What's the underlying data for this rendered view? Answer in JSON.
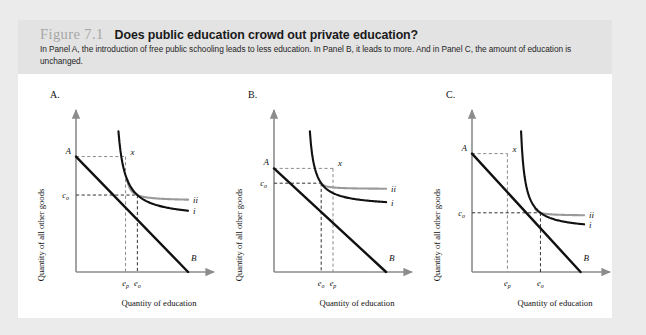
{
  "figure": {
    "number": "Figure 7.1",
    "title": "Does public education crowd out private education?",
    "caption": "In Panel A, the introduction of free public schooling leads to less education. In Panel B, it leads to more. And in Panel C, the amount of education is unchanged.",
    "background": "#ebebeb",
    "card_background": "#ffffff",
    "header_background": "#e3e3e3",
    "number_color": "#a6a6a6",
    "title_color": "#1a1a1a"
  },
  "axes": {
    "x_label": "Quantity of education",
    "y_label": "Quantity of all other goods",
    "axis_color": "#8c8c8c"
  },
  "styles": {
    "budget_line_color": "#111111",
    "curve_i_color": "#111111",
    "curve_ii_color": "#9a9a9a",
    "dashed_color": "#8c8c8c"
  },
  "labels": {
    "point_A": "A",
    "point_B": "B",
    "point_x": "x",
    "curve_i": "i",
    "curve_ii": "ii",
    "c_o_main": "c",
    "c_o_sub": "o",
    "e_p_main": "e",
    "e_p_sub": "p",
    "e_o_main": "e",
    "e_o_sub": "o"
  },
  "chart_data": {
    "type": "line",
    "title": "Does public education crowd out private education?",
    "xlabel": "Quantity of education",
    "ylabel": "Quantity of all other goods",
    "grid": false,
    "legend": "inline-curve-labels",
    "panels": [
      {
        "id": "A",
        "letter": "A.",
        "summary": "Introduction of free public schooling leads to less education.",
        "tick_order": [
          "e_p",
          "e_o"
        ],
        "x_ticks": [
          {
            "label": "e_p",
            "value": 0.42
          },
          {
            "label": "e_o",
            "value": 0.52
          }
        ],
        "y_ticks": [
          {
            "label": "c_o",
            "value": 0.52
          }
        ],
        "budget_line": {
          "name": "AB",
          "A_y": 0.78,
          "B_x": 0.95
        },
        "endowment_point_x": {
          "x": 0.42,
          "y": 0.78
        },
        "curve_i": {
          "name": "i",
          "x_asym": 0.3,
          "y_asym": 0.36
        },
        "curve_ii": {
          "name": "ii",
          "x_asym": 0.4,
          "y_asym": 0.48
        }
      },
      {
        "id": "B",
        "letter": "B.",
        "summary": "Introduction of free public schooling leads to more education.",
        "tick_order": [
          "e_o",
          "e_p"
        ],
        "x_ticks": [
          {
            "label": "e_o",
            "value": 0.4
          },
          {
            "label": "e_p",
            "value": 0.5
          }
        ],
        "y_ticks": [
          {
            "label": "c_o",
            "value": 0.6
          }
        ],
        "budget_line": {
          "name": "AB",
          "A_y": 0.7,
          "B_x": 0.95
        },
        "endowment_point_x": {
          "x": 0.5,
          "y": 0.7
        },
        "curve_i": {
          "name": "i",
          "x_asym": 0.26,
          "y_asym": 0.44
        },
        "curve_ii": {
          "name": "ii",
          "x_asym": 0.36,
          "y_asym": 0.56
        }
      },
      {
        "id": "C",
        "letter": "C.",
        "summary": "Amount of education is unchanged.",
        "tick_order": [
          "e_p",
          "e_o"
        ],
        "x_ticks": [
          {
            "label": "e_p",
            "value": 0.3
          },
          {
            "label": "e_o",
            "value": 0.58
          }
        ],
        "y_ticks": [
          {
            "label": "c_o",
            "value": 0.4
          }
        ],
        "budget_line": {
          "name": "AB",
          "A_y": 0.8,
          "B_x": 0.92
        },
        "endowment_point_x": {
          "x": 0.3,
          "y": 0.8
        },
        "curve_i": {
          "name": "i",
          "x_asym": 0.38,
          "y_asym": 0.28
        },
        "curve_ii": {
          "name": "ii",
          "x_asym": 0.5,
          "y_asym": 0.38
        }
      }
    ]
  }
}
